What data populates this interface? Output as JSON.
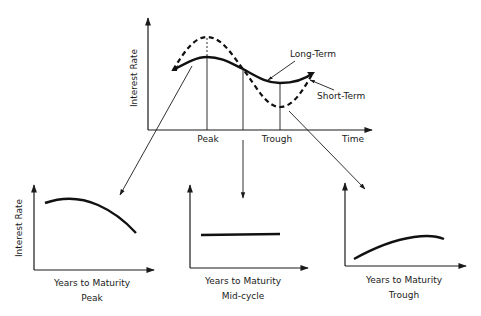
{
  "main_chart": {
    "ylabel": "Interest Rate",
    "xlabel": "Time",
    "x_markers": [
      "Peak",
      "Trough"
    ],
    "series": [
      {
        "name": "Long-Term",
        "style": "solid"
      },
      {
        "name": "Short-Term",
        "style": "dashed"
      }
    ],
    "annotations": {
      "long_term": "Long-Term",
      "short_term": "Short-Term"
    }
  },
  "panels": [
    {
      "id": "peak",
      "ylabel": "Interest Rate",
      "xlabel": "Years to Maturity",
      "caption": "Peak",
      "curve": "inverted (downward sloping)"
    },
    {
      "id": "mid",
      "ylabel": "",
      "xlabel": "Years to Maturity",
      "caption": "Mid-cycle",
      "curve": "flat"
    },
    {
      "id": "trough",
      "ylabel": "",
      "xlabel": "Years to Maturity",
      "caption": "Trough",
      "curve": "normal (upward sloping)"
    }
  ],
  "colors": {
    "ink": "#1a1a1a",
    "background": "#ffffff"
  }
}
